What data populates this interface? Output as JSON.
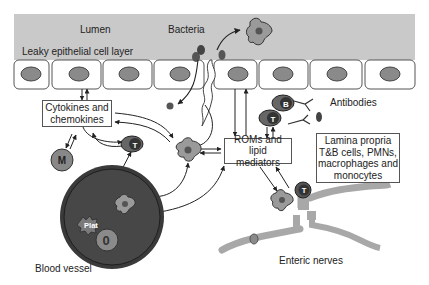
{
  "diagram": {
    "colors": {
      "lumen": "#c8c8c8",
      "nucleus": "#8a8a8a",
      "cell_border": "#555555",
      "vessel_outer": "#3a3a3a",
      "vessel_inner": "#4a4a4a",
      "nerve": "#a8a8a8",
      "arrow": "#222222"
    },
    "labels": {
      "lumen": "Lumen",
      "bacteria": "Bacteria",
      "epithelial_layer": "Leaky epithelial cell layer",
      "antibodies": "Antibodies",
      "blood_vessel": "Blood vessel",
      "enteric_nerves": "Enteric nerves"
    },
    "boxes": {
      "cytokines": {
        "line1": "Cytokines and",
        "line2": "chemokines"
      },
      "roms": {
        "line1": "ROMs and lipid",
        "line2": "mediators"
      },
      "lamina": {
        "line1": "Lamina propria",
        "line2": "T&B cells, PMNs,",
        "line3": "macrophages and",
        "line4": "monocytes"
      }
    },
    "cell_letters": {
      "t_cell": "T",
      "b_cell": "B",
      "monocyte": "M",
      "platelet": "Plat",
      "pmn": "0"
    },
    "epithelial_cell_count": 9
  }
}
